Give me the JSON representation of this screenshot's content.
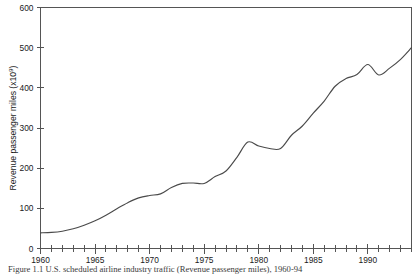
{
  "figure": {
    "caption": "Figure 1.1  U.S. scheduled airline industry traffic (Revenue passenger miles), 1960-94"
  },
  "chart_data": {
    "type": "line",
    "title": "",
    "xlabel": "",
    "ylabel": "Revenue passenger miles (x10⁹)",
    "ylabel_base": "Revenue passenger miles (x10",
    "ylabel_exponent": "9",
    "ylabel_tail": ")",
    "xlim": [
      1960,
      1994
    ],
    "ylim": [
      0,
      600
    ],
    "grid": false,
    "legend": null,
    "series_color": "#4a4a4a",
    "y_ticks": [
      0,
      100,
      200,
      300,
      400,
      500,
      600
    ],
    "y_tick_labels": [
      "0",
      "100",
      "200",
      "300",
      "400",
      "500",
      "600"
    ],
    "x_minor_tick_step": 1,
    "x_ticks": [
      1960,
      1965,
      1970,
      1975,
      1980,
      1985,
      1990
    ],
    "x_tick_labels": [
      "1960",
      "1965",
      "1970",
      "1975",
      "1980",
      "1985",
      "1990"
    ],
    "x": [
      1960,
      1961,
      1962,
      1963,
      1964,
      1965,
      1966,
      1967,
      1968,
      1969,
      1970,
      1971,
      1972,
      1973,
      1974,
      1975,
      1976,
      1977,
      1978,
      1979,
      1980,
      1981,
      1982,
      1983,
      1984,
      1985,
      1986,
      1987,
      1988,
      1989,
      1990,
      1991,
      1992,
      1993,
      1994
    ],
    "values": [
      39,
      40,
      43,
      49,
      58,
      69,
      83,
      99,
      114,
      126,
      132,
      136,
      152,
      162,
      163,
      162,
      179,
      193,
      227,
      265,
      255,
      249,
      249,
      282,
      305,
      337,
      367,
      404,
      423,
      433,
      458,
      432,
      449,
      471,
      500
    ]
  }
}
